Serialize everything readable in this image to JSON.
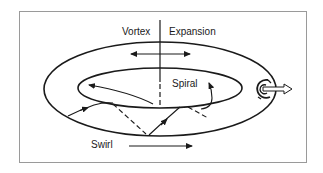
{
  "diagram": {
    "labels": {
      "vortex": "Vortex",
      "expansion": "Expansion",
      "spiral": "Spiral",
      "swirl": "Swirl"
    },
    "colors": {
      "stroke": "#1a1a1a",
      "frame": "#9a9a9a",
      "background": "#ffffff"
    },
    "elements": [
      {
        "id": "outer-ellipse",
        "type": "ellipse",
        "description": "outer torus boundary"
      },
      {
        "id": "inner-ellipse",
        "type": "ellipse",
        "description": "inner torus boundary"
      },
      {
        "id": "axis-line",
        "type": "line",
        "description": "vertical divider, solid then dashed"
      },
      {
        "id": "expansion-arrow",
        "type": "double-arrow",
        "description": "horizontal bidirectional arrow"
      },
      {
        "id": "spiral-path",
        "type": "path",
        "description": "zigzag spiral path with arrows and dashed continuations"
      },
      {
        "id": "swirl-arrow",
        "type": "arrow",
        "description": "rightward swirl arrow"
      },
      {
        "id": "vortex-symbol",
        "type": "swirl",
        "description": "circular vortex with outgoing hollow arrow"
      }
    ]
  }
}
